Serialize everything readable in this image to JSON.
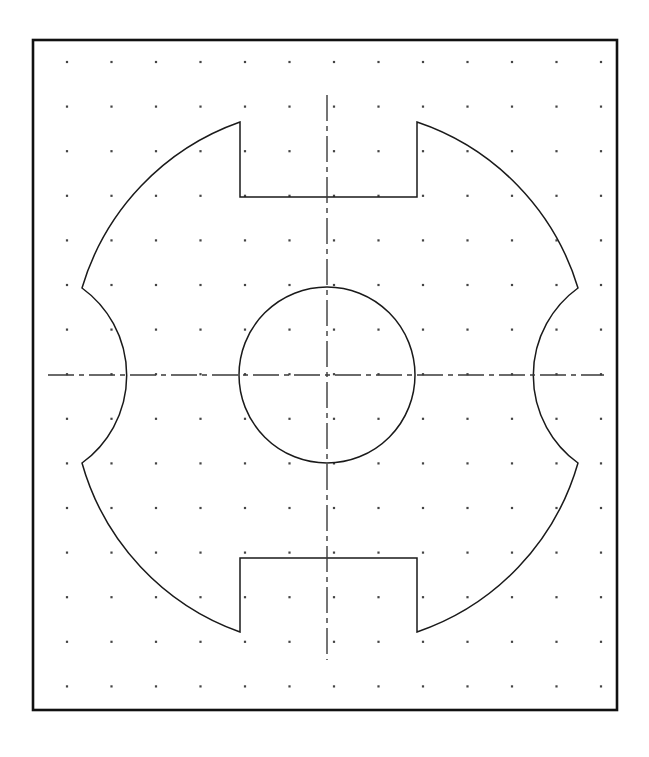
{
  "document": {
    "title": "Engineering Part Outline Drawing",
    "sheet_background": "#ffffff",
    "line_color": "#1a1a1a",
    "grid_dot_color": "#4a4a4a",
    "centerline_color": "#3a3a3a"
  },
  "sheet_border": {
    "name": "drawing-frame",
    "x": 33,
    "y": 40,
    "width": 584,
    "height": 670,
    "stroke_width": 2.6,
    "color": "#111111"
  },
  "grid": {
    "type": "dot-grid",
    "origin_x": 67,
    "origin_y": 62,
    "spacing_x": 44.5,
    "spacing_y": 44.6,
    "columns": 13,
    "rows": 15,
    "dot_radius": 1.1,
    "color": "#444444"
  },
  "part": {
    "name": "rotary-disc-with-notches",
    "center_x": 327,
    "center_y": 375,
    "outer_radius": 252,
    "bore_radius": 88,
    "notch_half_width": 88,
    "notch_left_x": 240,
    "notch_right_x": 417,
    "top_notch_floor_y": 197,
    "top_notch_shoulder_y": 122,
    "bottom_notch_ceiling_y": 558,
    "bottom_notch_shoulder_y": 632,
    "side_cut_radius": 108,
    "side_cut_left_apex_x": 154,
    "side_cut_right_apex_x": 503,
    "side_cut_vertex_top_y": 288,
    "side_cut_vertex_bottom_y": 463,
    "left_vertex_x": 82,
    "right_vertex_x": 578,
    "stroke_width": 1.5
  },
  "centerlines": {
    "style": "dash-dot",
    "stroke_width": 1.4,
    "dash_pattern": "26 5 5 5",
    "horizontal": {
      "label": "horizontal-centerline",
      "x1": 48,
      "y1": 375,
      "x2": 604,
      "y2": 375
    },
    "vertical": {
      "label": "vertical-centerline",
      "x1": 327,
      "y1": 95,
      "x2": 327,
      "y2": 660
    }
  },
  "chart_data": {
    "type": "scatter",
    "xlabel": "",
    "ylabel": "",
    "grid": true,
    "legend_position": "none",
    "categories": [],
    "values": []
  }
}
